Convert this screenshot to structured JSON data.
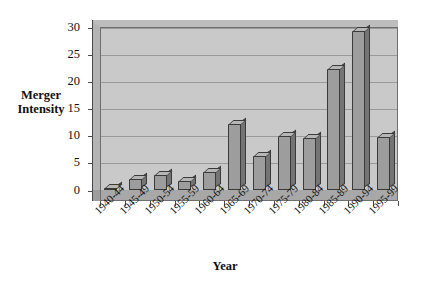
{
  "chart_data": {
    "type": "bar",
    "title": "",
    "xlabel": "Year",
    "ylabel": "Merger Intensity",
    "ylabel_lines": [
      "Merger",
      "Intensity"
    ],
    "categories": [
      "1940-44",
      "1945-49",
      "1950-54",
      "1955-59",
      "1960-64",
      "1965-69",
      "1970-74",
      "1975-79",
      "1980-84",
      "1985-89",
      "1990-94",
      "1995-99"
    ],
    "values": [
      0.3,
      2.0,
      2.8,
      1.7,
      3.3,
      12.2,
      6.3,
      10.0,
      9.5,
      22.3,
      29.2,
      9.7
    ],
    "yticks": [
      0,
      5,
      10,
      15,
      20,
      25,
      30
    ],
    "ytick_labels": [
      "0",
      "5",
      "10",
      "15",
      "20",
      "25",
      "30"
    ],
    "ylim": [
      0,
      30
    ],
    "grid": true,
    "legend": "none",
    "style": "3d-column",
    "colors": {
      "plot_background": "#c9c9c9",
      "bar_face": "#9d9d9d",
      "bar_side": "#747474",
      "bar_top": "#b6b6b6",
      "bar_outline": "#3a3a3a",
      "gridline": "#9a9a9a",
      "axis": "#4a4a4a",
      "text": "#111111",
      "page_background": "#ffffff"
    }
  }
}
